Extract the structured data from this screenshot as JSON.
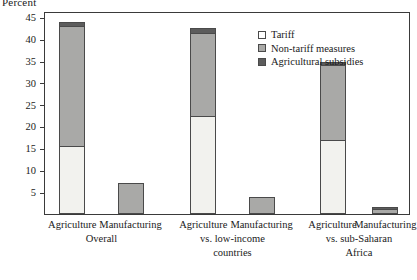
{
  "chart_data": {
    "type": "bar",
    "subtype": "stacked-bar",
    "title": "",
    "ylabel": "Percent",
    "xlabel": "",
    "ylim": [
      0,
      46
    ],
    "yticks": [
      5,
      10,
      15,
      20,
      25,
      30,
      35,
      40,
      45
    ],
    "grid": false,
    "legend_position": "top-right",
    "categories": [
      "Agriculture",
      "Manufacturing",
      "Agriculture",
      "Manufacturing",
      "Agriculture",
      "Manufacturing"
    ],
    "groups": [
      {
        "label": "Overall",
        "lines": [
          "Overall"
        ],
        "members": [
          0,
          1
        ]
      },
      {
        "label": "vs. low-income countries",
        "lines": [
          "vs. low-income",
          "countries"
        ],
        "members": [
          2,
          3
        ]
      },
      {
        "label": "vs. sub-Saharan Africa",
        "lines": [
          "vs. sub-Saharan",
          "Africa"
        ],
        "members": [
          4,
          5
        ]
      }
    ],
    "series": [
      {
        "name": "Tariff",
        "color": "#f2f2ee",
        "values": [
          15.5,
          0,
          22.5,
          0,
          17.0,
          0
        ]
      },
      {
        "name": "Non-tariff measures",
        "color": "#a9a9a7",
        "values": [
          27.5,
          7.0,
          19.0,
          4.0,
          17.0,
          1.2
        ]
      },
      {
        "name": "Agricultural subsidies",
        "color": "#5c5c5c",
        "values": [
          1.0,
          0,
          1.0,
          0,
          0.8,
          0.3
        ]
      }
    ],
    "totals": [
      44.0,
      7.0,
      42.5,
      4.0,
      34.8,
      1.5
    ]
  },
  "axis": {
    "y_title": "Percent",
    "ticks": [
      "45",
      "40",
      "35",
      "30",
      "25",
      "20",
      "15",
      "10",
      "5"
    ]
  },
  "legend": {
    "items": [
      {
        "label": "Tariff",
        "swatch": "tariff-swatch"
      },
      {
        "label": "Non-tariff measures",
        "swatch": "non-tariff-swatch"
      },
      {
        "label": "Agricultural subsidies",
        "swatch": "subsidies-swatch"
      }
    ]
  },
  "colors": {
    "tariff": "#f2f2ee",
    "non_tariff": "#a9a9a7",
    "subsidies": "#5c5c5c",
    "outline": "#4a4a4a",
    "frame": "#3a3a3a",
    "background": "#ffffff"
  }
}
